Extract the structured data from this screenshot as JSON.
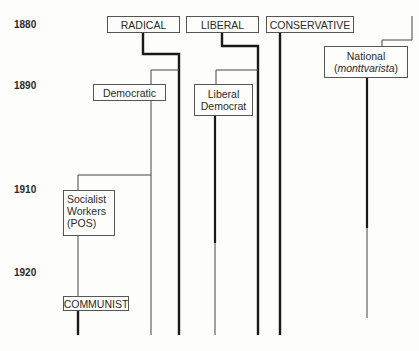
{
  "years": [
    {
      "label": "1880",
      "y": 19
    },
    {
      "label": "1890",
      "y": 80
    },
    {
      "label": "1910",
      "y": 184
    },
    {
      "label": "1920",
      "y": 267
    }
  ],
  "parties": {
    "radical": "RADICAL",
    "liberal": "LIBERAL",
    "conservative": "CONSERVATIVE",
    "democratic": "Democratic",
    "liberal_democrat_line1": "Liberal",
    "liberal_democrat_line2": "Democrat",
    "national_line1": "National",
    "national_paren_open": "(",
    "national_italic": "monttvarista",
    "national_paren_close": ")",
    "socialist_line1": "Socialist",
    "socialist_line2": "Workers",
    "socialist_line3": "(POS)",
    "communist": "COMMUNIST"
  },
  "colors": {
    "line": "#1a1a1a",
    "thin_line": "#444444",
    "box_border": "#555555",
    "background": "#fdfdfb"
  }
}
